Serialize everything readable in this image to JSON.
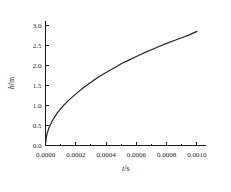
{
  "chart_data": {
    "type": "line",
    "title": "",
    "subtitle": "",
    "xlabel": "t/s",
    "xlabel_symbol": "t",
    "xlabel_unit": "s",
    "ylabel": "h/m",
    "ylabel_symbol": "h",
    "ylabel_unit": "m",
    "xlim": [
      0.0,
      0.00106
    ],
    "ylim": [
      0.0,
      3.12
    ],
    "grid": false,
    "legend": null,
    "legend_position": "none",
    "xticks": [
      0.0,
      0.0002,
      0.0004,
      0.0006,
      0.0008,
      0.001
    ],
    "xticklabels": [
      "0.0000",
      "0.0002",
      "0.0004",
      "0.0006",
      "0.0008",
      "0.0010"
    ],
    "yticks": [
      0.0,
      0.5,
      1.0,
      1.5,
      2.0,
      2.5,
      3.0
    ],
    "yticklabels": [
      "0.0",
      "0.5",
      "1.0",
      "1.5",
      "2.0",
      "2.5",
      "3.0"
    ],
    "axes_visible": [
      "left",
      "bottom"
    ],
    "tick_direction": "in",
    "series": [
      {
        "name": "h(t)",
        "color": "#222222",
        "x": [
          2e-06,
          5e-06,
          1e-05,
          2e-05,
          3e-05,
          4e-05,
          5e-05,
          7e-05,
          9e-05,
          0.00012,
          0.00015,
          0.00018,
          0.00021,
          0.00025,
          0.0003,
          0.00035,
          0.0004,
          0.00045,
          0.0005,
          0.00055,
          0.0006,
          0.00065,
          0.0007,
          0.00075,
          0.0008,
          0.00085,
          0.0009,
          0.00095,
          0.001
        ],
        "y": [
          0.09,
          0.2,
          0.29,
          0.41,
          0.5,
          0.58,
          0.65,
          0.77,
          0.87,
          1.0,
          1.12,
          1.22,
          1.32,
          1.44,
          1.58,
          1.71,
          1.82,
          1.93,
          2.04,
          2.13,
          2.22,
          2.31,
          2.39,
          2.47,
          2.55,
          2.62,
          2.69,
          2.76,
          2.85
        ]
      }
    ]
  }
}
